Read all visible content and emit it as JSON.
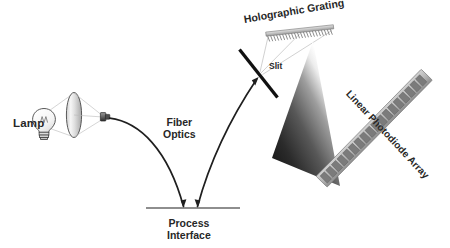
{
  "figure": {
    "type": "optical-schematic",
    "background_color": "#ffffff",
    "ink_color": "#272727"
  },
  "labels": {
    "lamp": "Lamp",
    "fiber_optics_line1": "Fiber",
    "fiber_optics_line2": "Optics",
    "process_interface_line1": "Process",
    "process_interface_line2": "Interface",
    "slit": "Slit",
    "holographic_grating": "Holographic Grating",
    "linear_photodiode_array": "Linear Photodiode Array"
  },
  "components": {
    "lamp": {
      "name": "tungsten lamp bulb",
      "bulb_center": [
        44,
        120
      ],
      "bulb_radius": 10.5,
      "base_label": "screw base"
    },
    "collimating_lens": {
      "name": "collimating lens",
      "center": [
        74,
        115
      ],
      "rx": 7.5,
      "ry": 22,
      "fill_light": "#f2f2f2",
      "fill_dark": "#a8a8a8"
    },
    "fiber_connector": {
      "name": "fiber optic connector ferrule",
      "position": [
        104,
        117
      ]
    },
    "fiber_cable_source": {
      "name": "source fiber leg",
      "from": [
        110,
        119
      ],
      "to": [
        186,
        208
      ]
    },
    "fiber_cable_return": {
      "name": "return fiber leg",
      "from": [
        198,
        208
      ],
      "to": [
        258,
        78
      ]
    },
    "process_interface": {
      "name": "process interface boundary line",
      "from": [
        148,
        208
      ],
      "to": [
        238,
        208
      ]
    },
    "slit_plate": {
      "name": "entrance slit plate",
      "from": [
        240,
        50
      ],
      "to": [
        277,
        97
      ],
      "stroke_width": 3.4
    },
    "grating": {
      "name": "holographic grating",
      "from": [
        268,
        36
      ],
      "to": [
        334,
        29
      ],
      "teeth": 22
    },
    "dispersion_fan": {
      "name": "dispersed spectrum beam",
      "apex": [
        313,
        42
      ],
      "edge_a": [
        336,
        183
      ],
      "edge_b": [
        274,
        160
      ],
      "gradient_from": "#1c1c1c",
      "gradient_to": "#ffffff"
    },
    "photodiode_array": {
      "name": "linear photodiode array detector",
      "from": [
        320,
        183
      ],
      "to": [
        428,
        73
      ],
      "pixel_count": 18,
      "frame_color": "#b4b4b4",
      "pixel_color": "#7d7d7d"
    }
  }
}
